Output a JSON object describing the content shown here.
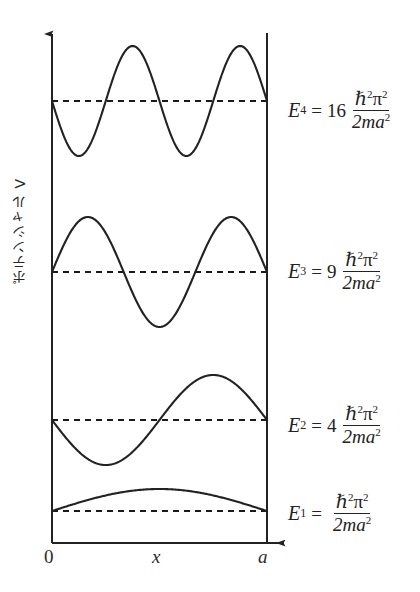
{
  "figure": {
    "title": "",
    "background_color": "#ffffff",
    "stroke_color": "#222222"
  },
  "axes": {
    "y_label": "ポテンシャル V",
    "x_ticks": [
      {
        "name": "origin",
        "label": "0"
      },
      {
        "name": "x-variable",
        "label": "x"
      },
      {
        "name": "well-width",
        "label": "a"
      }
    ]
  },
  "energy_levels": [
    {
      "id": "E4",
      "symbol": "E",
      "subscript": "4",
      "equals": "=",
      "coefficient": "16",
      "numerator_hbar": "ℏ",
      "numerator_hbar_exp": "2",
      "numerator_pi": "π",
      "numerator_pi_exp": "2",
      "denominator": "2ma",
      "denominator_exp": "2",
      "quantum_number": 4,
      "phase_sign": -1
    },
    {
      "id": "E3",
      "symbol": "E",
      "subscript": "3",
      "equals": "=",
      "coefficient": "9",
      "numerator_hbar": "ℏ",
      "numerator_hbar_exp": "2",
      "numerator_pi": "π",
      "numerator_pi_exp": "2",
      "denominator": "2ma",
      "denominator_exp": "2",
      "quantum_number": 3,
      "phase_sign": 1
    },
    {
      "id": "E2",
      "symbol": "E",
      "subscript": "2",
      "equals": "=",
      "coefficient": "4",
      "numerator_hbar": "ℏ",
      "numerator_hbar_exp": "2",
      "numerator_pi": "π",
      "numerator_pi_exp": "2",
      "denominator": "2ma",
      "denominator_exp": "2",
      "quantum_number": 2,
      "phase_sign": -1
    },
    {
      "id": "E1",
      "symbol": "E",
      "subscript": "1",
      "equals": "=",
      "coefficient": "",
      "numerator_hbar": "ℏ",
      "numerator_hbar_exp": "2",
      "numerator_pi": "π",
      "numerator_pi_exp": "2",
      "denominator": "2ma",
      "denominator_exp": "2",
      "quantum_number": 1,
      "phase_sign": 1
    }
  ],
  "chart_data": {
    "type": "line",
    "title": "",
    "xlabel": "x",
    "ylabel": "ポテンシャル V",
    "xlim": [
      0,
      1
    ],
    "ylim": [
      0,
      1
    ],
    "grid": false,
    "legend": false,
    "well": {
      "left_wall_x": 0,
      "right_wall_x": 1,
      "description": "infinite square well of width a"
    },
    "baselines_px": {
      "E4": 101,
      "E3": 272,
      "E2": 420,
      "E1": 511
    },
    "amplitudes_px": {
      "E4": 55,
      "E3": 55,
      "E2": 45,
      "E1": 22
    },
    "series": [
      {
        "name": "E4",
        "n": 4,
        "sign": -1,
        "formula": "psi_4(x) = -A sin(4*pi*x/a)",
        "baseline_value": 16
      },
      {
        "name": "E3",
        "n": 3,
        "sign": 1,
        "formula": "psi_3(x) = A sin(3*pi*x/a)",
        "baseline_value": 9
      },
      {
        "name": "E2",
        "n": 2,
        "sign": -1,
        "formula": "psi_2(x) = -A sin(2*pi*x/a)",
        "baseline_value": 4
      },
      {
        "name": "E1",
        "n": 1,
        "sign": 1,
        "formula": "psi_1(x) = A sin(pi*x/a)",
        "baseline_value": 1
      }
    ],
    "energy_ratios": [
      1,
      4,
      9,
      16
    ]
  },
  "geometry": {
    "left_wall_px": 52,
    "right_wall_px": 267,
    "bottom_axis_px": 543,
    "y_axis_top_px": 28,
    "x_axis_arrow_end_px": 292,
    "right_wall_top_px": 33
  }
}
